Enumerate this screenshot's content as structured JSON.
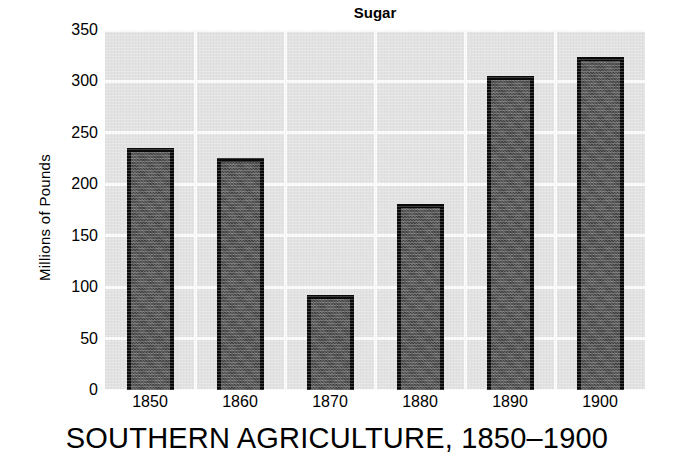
{
  "chart_data": {
    "type": "bar",
    "title": "Sugar",
    "xlabel": "",
    "ylabel": "Millions of Pounds",
    "categories": [
      "1850",
      "1860",
      "1870",
      "1880",
      "1890",
      "1900"
    ],
    "values": [
      235,
      226,
      92,
      181,
      305,
      324
    ],
    "ylim": [
      0,
      350
    ],
    "yticks": [
      0,
      50,
      100,
      150,
      200,
      250,
      300,
      350
    ],
    "ytick_labels": [
      "0",
      "50",
      "100",
      "150",
      "200",
      "250",
      "300",
      "350"
    ],
    "grid": true,
    "grid_color": "#fbfbfb",
    "legend": null,
    "bar_color": "#4c4c4c",
    "bar_edge_color": "#0a0a0a",
    "plot_background": "#e2e2e2"
  },
  "caption": {
    "text": "SOUTHERN AGRICULTURE, 1850–1900"
  }
}
